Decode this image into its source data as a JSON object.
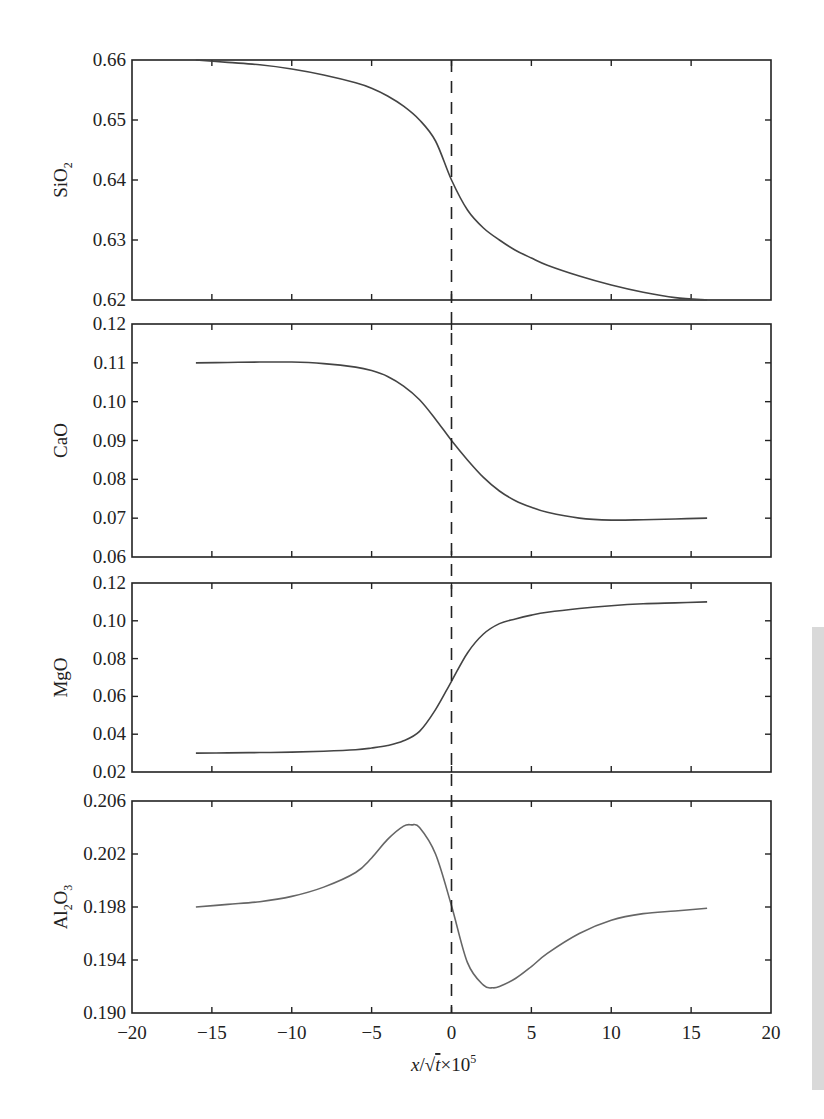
{
  "figure": {
    "xlabel_parts": {
      "x": "x",
      "slash": "/",
      "sqrt": "√",
      "t": "t",
      "times": "×10",
      "exp": "5"
    },
    "x_ticks": [
      "−20",
      "−15",
      "−10",
      "−5",
      "0",
      "5",
      "10",
      "15",
      "20"
    ],
    "boundary_line": {
      "x": 0,
      "style": "dashed"
    }
  },
  "chart_data": [
    {
      "type": "line",
      "title": "",
      "ylabel": "SiO2",
      "xlabel": "x/√t × 10^5",
      "xlim": [
        -20,
        20
      ],
      "ylim": [
        0.62,
        0.66
      ],
      "y_ticks": [
        "0.66",
        "0.65",
        "0.64",
        "0.63",
        "0.62"
      ],
      "grid": false,
      "x": [
        -16,
        -14,
        -12,
        -10,
        -8,
        -6,
        -5,
        -4,
        -3,
        -2,
        -1,
        0,
        1,
        2,
        3,
        4,
        5,
        6,
        8,
        10,
        12,
        14,
        16
      ],
      "values": [
        0.66,
        0.6596,
        0.6592,
        0.6585,
        0.6575,
        0.6562,
        0.6553,
        0.654,
        0.6523,
        0.65,
        0.6465,
        0.64,
        0.635,
        0.632,
        0.63,
        0.6283,
        0.627,
        0.6258,
        0.624,
        0.6225,
        0.6213,
        0.6204,
        0.62
      ]
    },
    {
      "type": "line",
      "title": "",
      "ylabel": "CaO",
      "xlabel": "x/√t × 10^5",
      "xlim": [
        -20,
        20
      ],
      "ylim": [
        0.06,
        0.12
      ],
      "y_ticks": [
        "0.12",
        "0.11",
        "0.10",
        "0.09",
        "0.08",
        "0.07",
        "0.06"
      ],
      "grid": false,
      "x": [
        -16,
        -14,
        -12,
        -10,
        -8,
        -6,
        -5,
        -4,
        -3,
        -2,
        -1,
        0,
        1,
        2,
        3,
        4,
        5,
        6,
        8,
        10,
        12,
        14,
        16
      ],
      "values": [
        0.11,
        0.1101,
        0.1102,
        0.1102,
        0.1098,
        0.1089,
        0.108,
        0.1065,
        0.104,
        0.1005,
        0.0955,
        0.09,
        0.085,
        0.0805,
        0.077,
        0.0745,
        0.0728,
        0.0715,
        0.07,
        0.0695,
        0.0696,
        0.0698,
        0.07
      ]
    },
    {
      "type": "line",
      "title": "",
      "ylabel": "MgO",
      "xlabel": "x/√t × 10^5",
      "xlim": [
        -20,
        20
      ],
      "ylim": [
        0.02,
        0.12
      ],
      "y_ticks": [
        "0.12",
        "0.10",
        "0.08",
        "0.06",
        "0.04",
        "0.02"
      ],
      "grid": false,
      "x": [
        -16,
        -14,
        -12,
        -10,
        -8,
        -6,
        -5,
        -4,
        -3,
        -2,
        -1,
        0,
        1,
        2,
        3,
        4,
        5,
        6,
        8,
        10,
        12,
        14,
        16
      ],
      "values": [
        0.03,
        0.0301,
        0.0303,
        0.0305,
        0.031,
        0.0318,
        0.0327,
        0.034,
        0.0365,
        0.0415,
        0.053,
        0.068,
        0.083,
        0.093,
        0.0985,
        0.101,
        0.103,
        0.1045,
        0.1065,
        0.108,
        0.109,
        0.1095,
        0.11
      ]
    },
    {
      "type": "line",
      "title": "",
      "ylabel": "Al2O3",
      "xlabel": "x/√t × 10^5",
      "xlim": [
        -20,
        20
      ],
      "ylim": [
        0.19,
        0.206
      ],
      "y_ticks": [
        "0.206",
        "0.202",
        "0.198",
        "0.194",
        "0.190"
      ],
      "grid": false,
      "x": [
        -16,
        -14,
        -12,
        -10,
        -8,
        -6,
        -5,
        -4,
        -3,
        -2.5,
        -2,
        -1,
        0,
        1,
        2,
        2.6,
        3,
        4,
        5,
        6,
        8,
        10,
        12,
        14,
        16
      ],
      "values": [
        0.198,
        0.1982,
        0.1984,
        0.1988,
        0.1995,
        0.2006,
        0.2017,
        0.2031,
        0.2041,
        0.2042,
        0.204,
        0.202,
        0.1981,
        0.1938,
        0.1921,
        0.1919,
        0.192,
        0.1926,
        0.1935,
        0.1945,
        0.196,
        0.197,
        0.1975,
        0.1977,
        0.1979
      ]
    }
  ]
}
